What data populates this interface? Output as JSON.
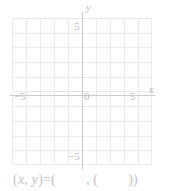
{
  "chart_data": {
    "type": "scatter",
    "title": "",
    "xlabel": "x",
    "ylabel": "y",
    "xlim": [
      -5,
      5
    ],
    "ylim": [
      -5,
      5
    ],
    "grid": true,
    "grid_step": 1,
    "legend": null,
    "series": [],
    "x_ticks": [
      -5,
      0,
      5
    ],
    "y_ticks": [
      -5,
      5
    ],
    "x_tick_labels": [
      "-5",
      "0",
      "5"
    ],
    "y_tick_labels": [
      "-5",
      "5"
    ],
    "annotations": []
  },
  "axes": {
    "x_axis_label": "x",
    "y_axis_label": "y",
    "origin_label": "0",
    "x_tick_neg5": "−5",
    "x_tick_pos5": "5",
    "y_tick_pos5": "5",
    "y_tick_neg5": "−5"
  },
  "answer": {
    "open": "(",
    "var_x": "x",
    "comma1": ", ",
    "var_y": "y",
    "close_eq": ")=(",
    "comma2": ", (",
    "close": "))"
  },
  "colors": {
    "background": "#ffffff",
    "grid_line": "#e9e9ee",
    "axis_line": "#c9c9cf",
    "label_text": "#b9b9c0",
    "answer_text": "#c2c2c8"
  }
}
